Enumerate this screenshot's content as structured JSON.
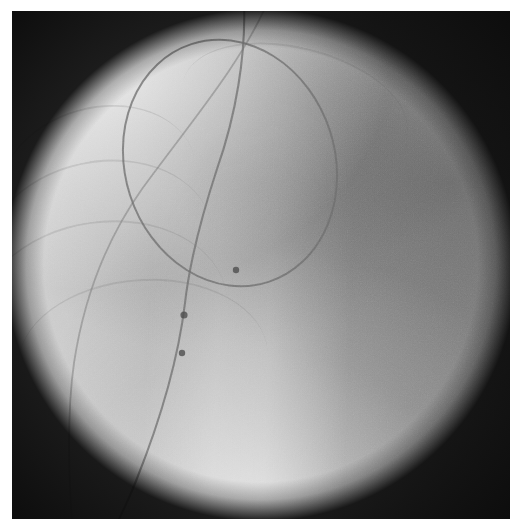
{
  "image": {
    "modality": "fluoroscopy",
    "view": "anteroposterior",
    "title": "Fluoroscopic image — circular mapping catheter in left atrium",
    "background_color": "#9a9a9a",
    "border_color": "#ffffff",
    "vignette_color": "#0d0d0d",
    "width": 522,
    "height": 531
  },
  "frame": {
    "x": 12,
    "y": 11,
    "width": 498,
    "height": 508
  },
  "anatomy": [
    {
      "name": "left-lung-field",
      "region": "upper-left",
      "density": "radiolucent",
      "tone": "#f2f2f2"
    },
    {
      "name": "mediastinum-soft-tissue",
      "region": "right",
      "density": "radiodense",
      "tone": "#8d8d8d"
    },
    {
      "name": "cardiac-silhouette",
      "region": "center",
      "density": "intermediate",
      "tone": "#a8a8a8"
    },
    {
      "name": "diaphragm-shadow",
      "region": "lower-right",
      "density": "radiodense",
      "tone": "#929292"
    },
    {
      "name": "spine-bright-band",
      "region": "lower-center",
      "density": "radiolucent",
      "tone": "#dcdcdc"
    }
  ],
  "ribs": [
    {
      "left": -14,
      "top": 96,
      "width": 200,
      "height": 150,
      "rotate": -16
    },
    {
      "left": -28,
      "top": 150,
      "width": 230,
      "height": 170,
      "rotate": -12
    },
    {
      "left": -34,
      "top": 210,
      "width": 250,
      "height": 180,
      "rotate": -8
    },
    {
      "left": 6,
      "top": 268,
      "width": 250,
      "height": 160,
      "rotate": -4
    },
    {
      "left": 168,
      "top": 36,
      "width": 230,
      "height": 120,
      "rotate": 14
    }
  ],
  "devices": [
    {
      "name": "circular-mapping-catheter",
      "label": "Lasso circular mapping catheter",
      "shape": "ellipse",
      "cx": 218,
      "cy": 152,
      "rx": 105,
      "ry": 125,
      "rotate": -18,
      "stroke_width": 2.0,
      "color": "#6b6b6b"
    },
    {
      "name": "transseptal-sheath-catheter",
      "label": "Catheter shaft descending from superior vena cava",
      "shape": "path",
      "path": "M 232 -8 C 234 44, 224 104, 205 158 C 190 204, 178 248, 173 292 C 167 342, 152 400, 124 470 C 112 500, 104 514, 100 521",
      "stroke_width": 2.1,
      "color": "#6f6f6f"
    },
    {
      "name": "coronary-sinus-catheter",
      "label": "Secondary catheter curving along left heart border",
      "shape": "path",
      "path": "M 256 -10 C 230 52, 178 112, 130 178 C 96 226, 72 286, 62 352 C 55 400, 56 452, 60 512",
      "stroke_width": 1.8,
      "color": "#7b7b7b"
    }
  ],
  "electrodes": [
    {
      "name": "electrode-marker-1",
      "cx": 172,
      "cy": 304,
      "r": 3.6
    },
    {
      "name": "electrode-marker-2",
      "cx": 170,
      "cy": 342,
      "r": 3.2
    },
    {
      "name": "electrode-marker-loop",
      "cx": 224,
      "cy": 259,
      "r": 3.2
    }
  ],
  "annotations": {
    "visible_text": [],
    "overlay_labels": []
  }
}
